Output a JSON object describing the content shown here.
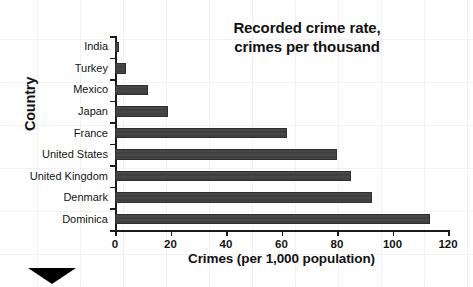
{
  "chart_data": {
    "type": "bar",
    "orientation": "horizontal",
    "title": "Recorded crime rate, crimes per thousand",
    "title_lines": [
      "Recorded crime rate,",
      "crimes per thousand"
    ],
    "xlabel": "Crimes (per 1,000 population)",
    "ylabel": "Country",
    "categories": [
      "India",
      "Turkey",
      "Mexico",
      "Japan",
      "France",
      "United States",
      "United Kingdom",
      "Denmark",
      "Dominica"
    ],
    "values": [
      1.5,
      4,
      12,
      19,
      62,
      80,
      85,
      92.5,
      113.5
    ],
    "xlim": [
      0,
      120
    ],
    "xticks": [
      0,
      20,
      40,
      60,
      80,
      100,
      120
    ],
    "xtick_labels": [
      "0",
      "20",
      "40",
      "60",
      "80",
      "100",
      "120"
    ],
    "grid": false,
    "legend": false,
    "bar_color": "#424242",
    "bar_edge_color": "#2e2e2e",
    "axis_color": "#1a1a1a",
    "background": "#ffffff"
  },
  "decoration": {
    "corner_marker": "black-triangle"
  }
}
